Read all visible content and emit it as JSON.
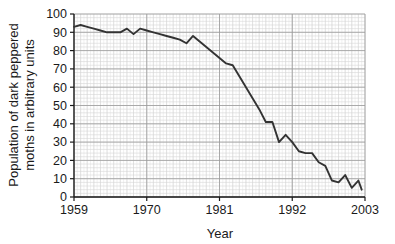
{
  "chart_data": {
    "type": "line",
    "title": "",
    "xlabel": "Year",
    "ylabel": "Population of dark peppered moths in arbitrary units",
    "ylabel_line1": "Population of dark peppered",
    "ylabel_line2": "moths in arbitrary units",
    "xlim": [
      1959,
      2003
    ],
    "ylim": [
      0,
      100
    ],
    "yticks": [
      0,
      10,
      20,
      30,
      40,
      50,
      60,
      70,
      80,
      90,
      100
    ],
    "ytick_labels": [
      "0",
      "10",
      "20",
      "30",
      "40",
      "50",
      "60",
      "70",
      "80",
      "90",
      "100"
    ],
    "xticks": [
      1959,
      1970,
      1981,
      1992,
      2003
    ],
    "xtick_labels": [
      "1959",
      "1970",
      "1981",
      "1992",
      "2003"
    ],
    "grid": true,
    "grid_minor_step_x": 1,
    "grid_minor_step_y": 2,
    "grid_major_step_x": 11,
    "grid_major_step_y": 10,
    "legend": null,
    "legend_position": "none",
    "line_color": "#333333",
    "grid_minor_color": "#cfcfcf",
    "grid_major_color": "#9a9a9a",
    "axis_color": "#1a1a1a",
    "background_color": "#ffffff",
    "series": [
      {
        "name": "Dark peppered moth population",
        "x": [
          1959,
          1960,
          1961,
          1962,
          1963,
          1964,
          1965,
          1966,
          1967,
          1968,
          1969,
          1970,
          1971,
          1972,
          1973,
          1974,
          1975,
          1976,
          1977,
          1978,
          1979,
          1980,
          1981,
          1982,
          1983,
          1984,
          1985,
          1986,
          1987,
          1988,
          1989,
          1990,
          1991,
          1992,
          1993,
          1994,
          1995,
          1996,
          1997,
          1998,
          1999,
          2000,
          2001,
          2002
        ],
        "values": [
          93,
          94,
          93,
          92,
          91,
          90,
          90,
          90,
          92,
          89,
          92,
          91,
          90,
          89,
          88,
          87,
          86,
          84,
          88,
          85,
          82,
          79,
          76,
          73,
          72,
          66,
          60,
          54,
          48,
          41,
          41,
          30,
          34,
          30,
          25,
          24,
          24,
          19,
          17,
          9,
          8,
          12,
          5,
          9
        ],
        "final_x": 2002.5,
        "final_value": 4
      }
    ],
    "annotations": []
  }
}
